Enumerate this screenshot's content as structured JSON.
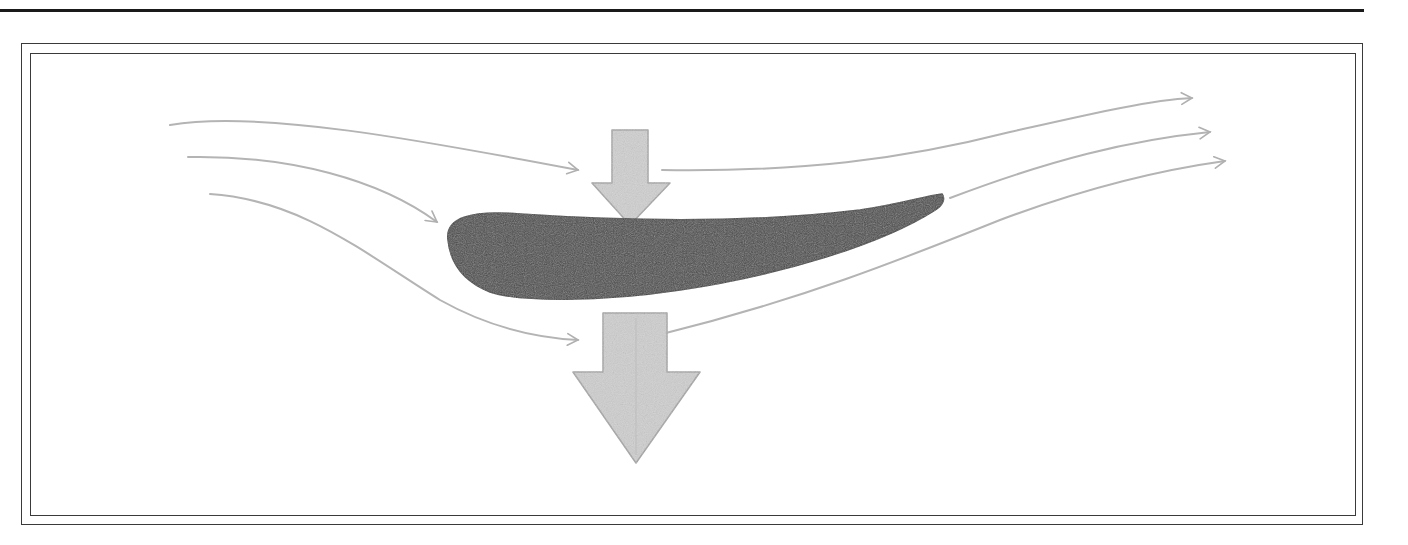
{
  "figure": {
    "description": "Hand-drawn airfoil with airflow streamlines and downward force arrows",
    "colors": {
      "rule": "#1a1a1a",
      "frame": "#3a3a3a",
      "streamline": "#b4b4b4",
      "airfoil_fill": "#4a4a4a",
      "airfoil_edge": "#3a3a3a",
      "force_arrow_fill": "#cfcfcf",
      "force_arrow_edge": "#a6a6a6"
    },
    "streamlines_upstream": [
      {
        "id": "upper",
        "path": "M170 125 C 260 110, 420 140, 578 170"
      },
      {
        "id": "middle",
        "path": "M188 157 C 290 155, 380 180, 437 222"
      },
      {
        "id": "lower",
        "path": "M210 194 C 300 200, 360 250, 440 300 C 490 328, 540 338, 578 340"
      }
    ],
    "streamlines_downstream": [
      {
        "id": "upper",
        "path": "M662 170 C 800 172, 900 160, 1010 132 C 1090 114, 1150 100, 1192 98"
      },
      {
        "id": "middle",
        "path": "M950 198 C 1050 160, 1130 140, 1210 132"
      },
      {
        "id": "lower",
        "path": "M662 334 C 800 300, 900 260, 1000 220 C 1080 190, 1160 170, 1225 161"
      }
    ],
    "airfoil": {
      "label": "airfoil",
      "path": "M448 240 C 445 218, 470 210, 520 214 C 640 222, 760 222, 860 210 C 900 204, 925 196, 942 194 C 945 198, 944 205, 935 210 C 880 245, 780 275, 680 290 C 600 302, 520 302, 490 292 C 460 280, 450 260, 448 240 Z"
    },
    "force_arrows": [
      {
        "id": "small-top",
        "label": "small downward force arrow",
        "points": "612,130 648,130 648,183 670,183 630,225 592,183 612,183"
      },
      {
        "id": "large-bottom",
        "label": "large downward force arrow",
        "points": "603,313 667,313 667,372 700,372 636,463 573,372 603,372"
      }
    ]
  }
}
